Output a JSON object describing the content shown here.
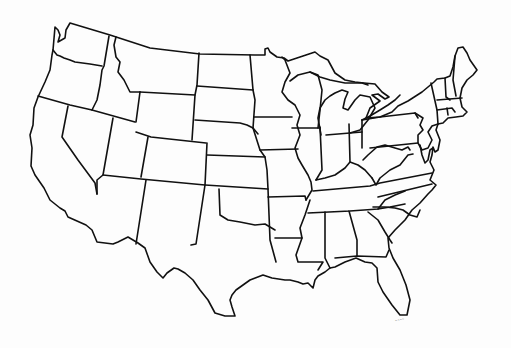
{
  "map": {
    "title": "Outline Map of the Contiguous United States",
    "style": "blank outline, black lines on white",
    "line_color": "#111111",
    "background_color": "#fdfdfd",
    "signature": "~~~~",
    "states": [
      "Washington",
      "Oregon",
      "California",
      "Idaho",
      "Nevada",
      "Montana",
      "Wyoming",
      "Utah",
      "Arizona",
      "Colorado",
      "New Mexico",
      "North Dakota",
      "South Dakota",
      "Nebraska",
      "Kansas",
      "Oklahoma",
      "Texas",
      "Minnesota",
      "Iowa",
      "Missouri",
      "Arkansas",
      "Louisiana",
      "Wisconsin",
      "Illinois",
      "Michigan",
      "Indiana",
      "Ohio",
      "Kentucky",
      "Tennessee",
      "Mississippi",
      "Alabama",
      "Georgia",
      "Florida",
      "South Carolina",
      "North Carolina",
      "Virginia",
      "West Virginia",
      "Maryland",
      "Delaware",
      "Pennsylvania",
      "New Jersey",
      "New York",
      "Connecticut",
      "Rhode Island",
      "Massachusetts",
      "Vermont",
      "New Hampshire",
      "Maine"
    ]
  }
}
